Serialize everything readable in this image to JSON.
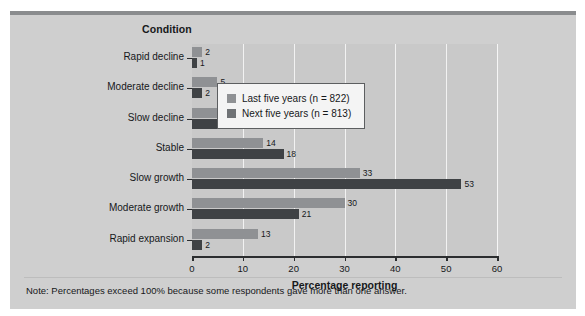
{
  "figure": {
    "top_cut_text": "",
    "panel_bg": "#cfcfcf",
    "note": "Note: Percentages exceed 100% because some respondents gave more than one answer."
  },
  "chart_data": {
    "type": "bar",
    "orientation": "horizontal",
    "title": "",
    "xlabel": "Percentage reporting",
    "ylabel": "Condition",
    "xlim": [
      0,
      60
    ],
    "xticks": [
      0,
      10,
      20,
      30,
      40,
      50,
      60
    ],
    "xtick_labels": [
      "0",
      "10",
      "20",
      "30",
      "40",
      "50",
      "60"
    ],
    "grid": true,
    "grid_axis": "x",
    "legend_position": "upper right",
    "categories": [
      "Rapid decline",
      "Moderate decline",
      "Slow decline",
      "Stable",
      "Slow growth",
      "Moderate growth",
      "Rapid expansion"
    ],
    "series": [
      {
        "name": "Last five years (n = 822)",
        "color": "#8f9194",
        "values": [
          2,
          5,
          8,
          14,
          33,
          30,
          13
        ],
        "value_labels": [
          "2",
          "5",
          "8",
          "14",
          "33",
          "30",
          "13"
        ]
      },
      {
        "name": "Next five years (n = 813)",
        "color": "#3f4245",
        "values": [
          1,
          2,
          6,
          18,
          53,
          21,
          2
        ],
        "value_labels": [
          "1",
          "2",
          "6",
          "18",
          "53",
          "21",
          "2"
        ]
      }
    ],
    "note": "Note: Percentages exceed 100% because some respondents gave more than one answer."
  }
}
